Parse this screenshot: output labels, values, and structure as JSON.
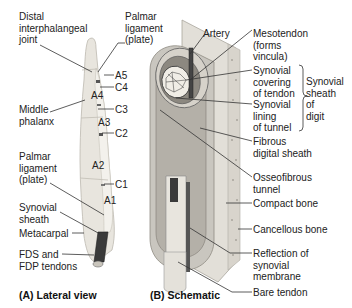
{
  "panel_a": {
    "caption": "(A) Lateral view",
    "labels": {
      "dip_joint": "Distal\ninterphalangeal\njoint",
      "palmar_ligament_top": "Palmar\nligament\n(plate)",
      "middle_phalanx": "Middle\nphalanx",
      "palmar_ligament_bottom": "Palmar\nligament\n(plate)",
      "synovial_sheath": "Synovial\nsheath",
      "metacarpal": "Metacarpal",
      "fds_fdp": "FDS and\nFDP tendons"
    },
    "pulleys": {
      "a5": "A5",
      "c4": "C4",
      "a4": "A4",
      "c3": "C3",
      "a3": "A3",
      "c2": "C2",
      "a2": "A2",
      "c1": "C1",
      "a1": "A1"
    }
  },
  "panel_b": {
    "caption": "(B) Schematic",
    "labels": {
      "artery": "Artery",
      "mesotendon": "Mesotendon\n(forms\nvincula)",
      "synovial_covering": "Synovial\ncovering\nof tendon",
      "synovial_lining": "Synovial\nlining\nof tunnel",
      "synovial_sheath_digit": "Synovial\nsheath\nof\ndigit",
      "fibrous_sheath": "Fibrous\ndigital sheath",
      "osseofibrous": "Osseofibrous\ntunnel",
      "compact_bone": "Compact bone",
      "cancellous_bone": "Cancellous bone",
      "reflection": "Reflection of\nsynovial\nmembrane",
      "bare_tendon": "Bare tendon"
    }
  },
  "colors": {
    "bone": "#e6e3dc",
    "bone_shade": "#c9c5bc",
    "tendon_dark": "#3b3b3b",
    "sheath": "#bdbab3",
    "leader": "#333333"
  }
}
